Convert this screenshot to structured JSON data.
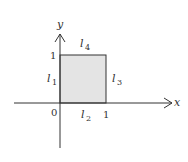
{
  "diagram": {
    "axes": {
      "x_label": "x",
      "y_label": "y",
      "origin_label": "0"
    },
    "ticks": {
      "x_one": "1",
      "y_one": "1"
    },
    "square": {
      "fill": "#e4e4e4",
      "stroke": "#333333"
    },
    "edges": [
      {
        "name": "l",
        "sub": "1",
        "side": "left"
      },
      {
        "name": "l",
        "sub": "2",
        "side": "bottom"
      },
      {
        "name": "l",
        "sub": "3",
        "side": "right"
      },
      {
        "name": "l",
        "sub": "4",
        "side": "top"
      }
    ]
  }
}
